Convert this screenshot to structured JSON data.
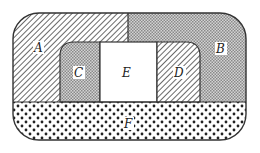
{
  "diagram": {
    "type": "region-partition",
    "regions": [
      {
        "id": "A",
        "label": "A",
        "fill": "diagonal-hatch",
        "position": "outer ring, top-left and left side"
      },
      {
        "id": "B",
        "label": "B",
        "fill": "fine-checker-gray",
        "position": "outer ring, top-right and right side"
      },
      {
        "id": "C",
        "label": "C",
        "fill": "fine-checker-gray",
        "position": "inner left"
      },
      {
        "id": "D",
        "label": "D",
        "fill": "diagonal-hatch",
        "position": "inner right"
      },
      {
        "id": "E",
        "label": "E",
        "fill": "white",
        "position": "center"
      },
      {
        "id": "F",
        "label": "F",
        "fill": "dots",
        "position": "bottom band"
      }
    ],
    "colors": {
      "stroke": "#333333",
      "hatch": "#444444",
      "checker": "#888888",
      "dot": "#222222",
      "background": "#ffffff"
    }
  }
}
